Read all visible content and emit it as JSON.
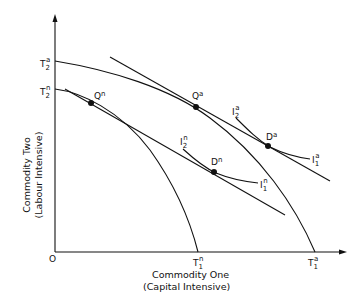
{
  "diagram": {
    "type": "production-possibility-frontier",
    "origin_label": "O",
    "x_axis": {
      "title_line1": "Commodity One",
      "title_line2": "(Capital Intensive)"
    },
    "y_axis": {
      "title_line1": "Commodity Two",
      "title_line2": "(Labour Intensive)"
    },
    "points": [
      {
        "id": "Qn",
        "base": "Q",
        "sup": "n"
      },
      {
        "id": "Qa",
        "base": "Q",
        "sup": "a"
      },
      {
        "id": "Dn",
        "base": "D",
        "sup": "n"
      },
      {
        "id": "Da",
        "base": "D",
        "sup": "a"
      }
    ],
    "intercepts": {
      "T2a": {
        "base": "T",
        "sub": "2",
        "sup": "a"
      },
      "T2n": {
        "base": "T",
        "sub": "2",
        "sup": "n"
      },
      "T1n": {
        "base": "T",
        "sub": "1",
        "sup": "n"
      },
      "T1a": {
        "base": "T",
        "sub": "1",
        "sup": "a"
      }
    },
    "indifference_curves": {
      "I2a": {
        "base": "I",
        "sub": "2",
        "sup": "a"
      },
      "I1a": {
        "base": "I",
        "sub": "1",
        "sup": "a"
      },
      "I2n": {
        "base": "I",
        "sub": "2",
        "sup": "n"
      },
      "I1n": {
        "base": "I",
        "sub": "1",
        "sup": "n"
      }
    }
  }
}
